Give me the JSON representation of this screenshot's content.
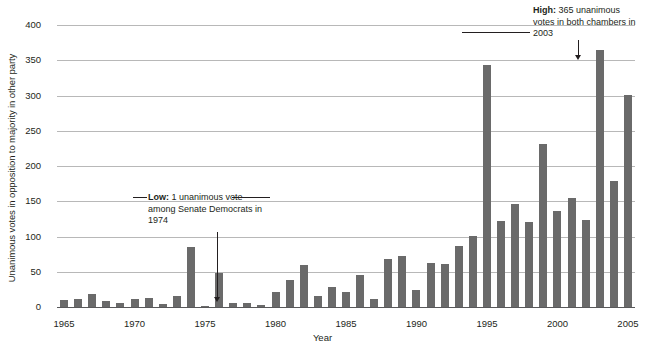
{
  "chart_data": {
    "type": "bar",
    "title": "",
    "xlabel": "Year",
    "ylabel": "Unanimous votes in opposition to majority in other party",
    "ylim": [
      0,
      400
    ],
    "ytick_labels": [
      "0",
      "50",
      "100",
      "150",
      "200",
      "250",
      "300",
      "350",
      "400"
    ],
    "ytick_values": [
      0,
      50,
      100,
      150,
      200,
      250,
      300,
      350,
      400
    ],
    "xtick_labels": [
      "1965",
      "1970",
      "1975",
      "1980",
      "1985",
      "1990",
      "1995",
      "2000",
      "2005"
    ],
    "xtick_values": [
      1965,
      1970,
      1975,
      1980,
      1985,
      1990,
      1995,
      2000,
      2005
    ],
    "grid": true,
    "legend": false,
    "bar_color": "#6a6a6a",
    "gridline_color": "#b8b8b8",
    "axis_color": "#58585a",
    "categories": [
      1965,
      1966,
      1967,
      1968,
      1969,
      1970,
      1971,
      1972,
      1973,
      1974,
      1975,
      1976,
      1977,
      1978,
      1979,
      1980,
      1981,
      1982,
      1983,
      1984,
      1985,
      1986,
      1987,
      1988,
      1989,
      1990,
      1991,
      1992,
      1993,
      1994,
      1995,
      1996,
      1997,
      1998,
      1999,
      2000,
      2001,
      2002,
      2003,
      2004,
      2005
    ],
    "values": [
      10,
      11,
      18,
      9,
      6,
      12,
      13,
      4,
      15,
      85,
      1,
      48,
      6,
      5,
      3,
      21,
      38,
      59,
      16,
      29,
      21,
      46,
      11,
      68,
      72,
      24,
      62,
      61,
      86,
      101,
      343,
      122,
      146,
      120,
      231,
      136,
      155,
      123,
      365,
      179,
      301
    ]
  },
  "annotations": {
    "low": {
      "label": "Low:",
      "text": " 1 unanimous vote among Senate Democrats in 1974",
      "full": "Low: 1 unanimous vote among Senate Democrats in 1974",
      "target_year": 1975,
      "target_value": 1
    },
    "high": {
      "label": "High:",
      "text": " 365 unanimous votes in both chambers in 2003",
      "full": "High: 365 unanimous votes in both chambers in 2003",
      "target_year": 2003,
      "target_value": 365
    }
  }
}
